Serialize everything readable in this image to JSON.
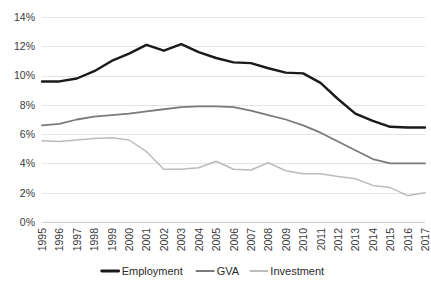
{
  "chart_data": {
    "type": "line",
    "title": "",
    "xlabel": "",
    "ylabel": "",
    "ylim": [
      0,
      14
    ],
    "ytick_labels": [
      "0%",
      "2%",
      "4%",
      "6%",
      "8%",
      "10%",
      "12%",
      "14%"
    ],
    "ytick_values": [
      0,
      2,
      4,
      6,
      8,
      10,
      12,
      14
    ],
    "grid": true,
    "legend_position": "bottom",
    "categories": [
      "1995",
      "1996",
      "1997",
      "1998",
      "1999",
      "2000",
      "2001",
      "2002",
      "2003",
      "2004",
      "2005",
      "2006",
      "2007",
      "2008",
      "2009",
      "2010",
      "2011",
      "2012",
      "2013",
      "2014",
      "2015",
      "2016",
      "2017"
    ],
    "series": [
      {
        "name": "Employment",
        "color": "#1a1a1a",
        "width": 2.4,
        "values": [
          9.6,
          9.6,
          9.8,
          10.3,
          11.0,
          11.5,
          12.1,
          11.7,
          12.15,
          11.6,
          11.2,
          10.9,
          10.85,
          10.5,
          10.2,
          10.15,
          9.5,
          8.4,
          7.4,
          6.9,
          6.5,
          6.45,
          6.45
        ]
      },
      {
        "name": "GVA",
        "color": "#7a7a7a",
        "width": 1.8,
        "values": [
          6.6,
          6.7,
          7.0,
          7.2,
          7.3,
          7.4,
          7.55,
          7.7,
          7.85,
          7.9,
          7.9,
          7.85,
          7.6,
          7.3,
          7.0,
          6.6,
          6.1,
          5.5,
          4.9,
          4.3,
          4.0,
          4.0,
          4.0
        ]
      },
      {
        "name": "Investment",
        "color": "#bcbcbc",
        "width": 1.5,
        "values": [
          5.55,
          5.5,
          5.6,
          5.7,
          5.75,
          5.6,
          4.8,
          3.6,
          3.6,
          3.7,
          4.15,
          3.6,
          3.55,
          4.05,
          3.5,
          3.3,
          3.3,
          3.1,
          2.95,
          2.5,
          2.35,
          1.8,
          2.0
        ]
      }
    ]
  },
  "legend": {
    "items": [
      {
        "label": "Employment"
      },
      {
        "label": "GVA"
      },
      {
        "label": "Investment"
      }
    ]
  }
}
